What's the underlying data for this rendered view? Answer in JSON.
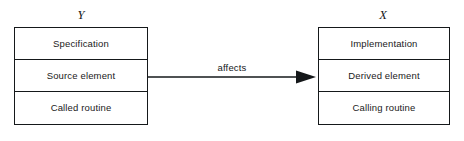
{
  "diagram": {
    "type": "entity-relationship",
    "entities": [
      {
        "id": "Y",
        "label": "Y",
        "side": "left",
        "rows": [
          {
            "label": "Specification"
          },
          {
            "label": "Source element"
          },
          {
            "label": "Called routine"
          }
        ]
      },
      {
        "id": "X",
        "label": "X",
        "side": "right",
        "rows": [
          {
            "label": "Implementation"
          },
          {
            "label": "Derived element"
          },
          {
            "label": "Calling routine"
          }
        ]
      }
    ],
    "relation": {
      "label": "affects",
      "from": "Y.Source element",
      "to": "X.Derived element",
      "arrow_head": "solid-triangle",
      "direction": "left-to-right"
    },
    "colors": {
      "stroke": "#15181a",
      "background": "#ffffff",
      "text": "#15181a"
    }
  }
}
